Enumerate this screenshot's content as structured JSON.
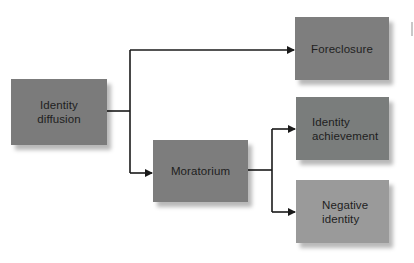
{
  "diagram": {
    "nodes": {
      "identity_diffusion": {
        "label": "Identity\ndiffusion",
        "color": "#7b7b7b"
      },
      "moratorium": {
        "label": "Moratorium",
        "color": "#7d7d7d"
      },
      "foreclosure": {
        "label": "Foreclosure",
        "color": "#7e7e7e"
      },
      "identity_achievement": {
        "label": "Identity\nachievement",
        "color": "#7a7d7c"
      },
      "negative_identity": {
        "label": "Negative\nidentity",
        "color": "#9a9a9a"
      }
    },
    "edges": [
      {
        "from": "Identity diffusion",
        "to": "Foreclosure"
      },
      {
        "from": "Identity diffusion",
        "to": "Moratorium"
      },
      {
        "from": "Moratorium",
        "to": "Identity achievement"
      },
      {
        "from": "Moratorium",
        "to": "Negative identity"
      }
    ],
    "line_color": "#1a1a1a"
  }
}
